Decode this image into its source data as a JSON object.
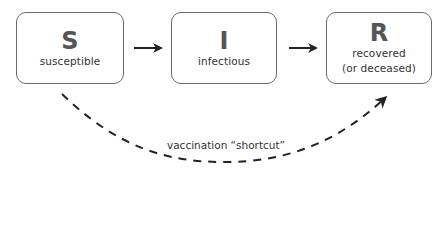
{
  "diagram": {
    "nodes": [
      {
        "id": "S",
        "letter": "S",
        "label": "susceptible",
        "sublabel": ""
      },
      {
        "id": "I",
        "letter": "I",
        "label": "infectious",
        "sublabel": ""
      },
      {
        "id": "R",
        "letter": "R",
        "label": "recovered",
        "sublabel": "(or deceased)"
      }
    ],
    "edges": [
      {
        "from": "S",
        "to": "I",
        "style": "solid",
        "label": ""
      },
      {
        "from": "I",
        "to": "R",
        "style": "solid",
        "label": ""
      },
      {
        "from": "S",
        "to": "R",
        "style": "dashed",
        "label": "vaccination “shortcut”"
      }
    ],
    "colors": {
      "box_border": "#6b6b6b",
      "letter": "#555555",
      "text": "#333333",
      "arrow": "#222222"
    }
  }
}
